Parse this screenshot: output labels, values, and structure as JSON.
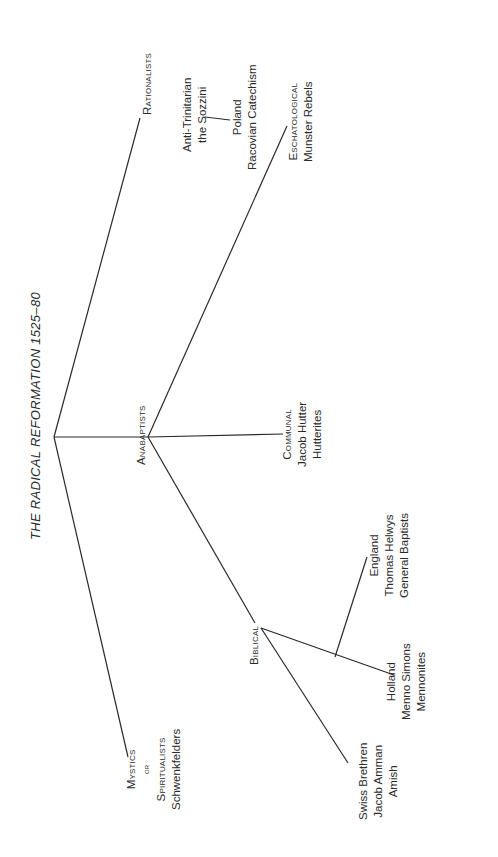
{
  "title": "THE RADICAL REFORMATION 1525–80",
  "nodes": {
    "rationalists": {
      "label": "Rationalists"
    },
    "anti_trinitarian": {
      "lines": [
        "Anti-Trinitarian",
        "the Sozzini"
      ]
    },
    "poland": {
      "lines": [
        "Poland",
        "Racovian Catechism"
      ]
    },
    "anabaptists": {
      "label": "Anabaptists"
    },
    "eschatological": {
      "label": "Eschatological",
      "lines": [
        "Munster Rebels"
      ]
    },
    "communal": {
      "label": "Communal",
      "lines": [
        "Jacob Hutter",
        "Hutterites"
      ]
    },
    "biblical": {
      "label": "Biblical"
    },
    "england": {
      "lines": [
        "England",
        "Thomas Helwys",
        "General Baptists"
      ]
    },
    "holland": {
      "lines": [
        "Holland",
        "Menno Simons",
        "Mennonites"
      ]
    },
    "swiss": {
      "lines": [
        "Swiss Brethren",
        "Jacob Amman",
        "Amish"
      ]
    },
    "mystics": {
      "label_1": "Mystics",
      "label_or": "or",
      "label_2": "Spiritualists",
      "lines": [
        "Schwenkfelders"
      ]
    }
  }
}
